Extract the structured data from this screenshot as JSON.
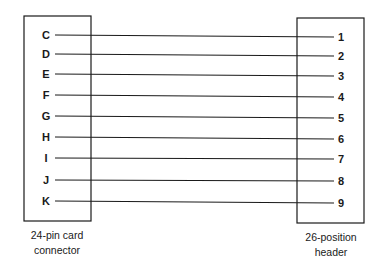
{
  "diagram": {
    "type": "wiring",
    "left_connector": {
      "caption_line1": "24-pin card",
      "caption_line2": "connector",
      "pins": [
        "C",
        "D",
        "E",
        "F",
        "G",
        "H",
        "I",
        "J",
        "K"
      ]
    },
    "right_connector": {
      "caption_line1": "26-position",
      "caption_line2": "header",
      "pins": [
        "1",
        "2",
        "3",
        "4",
        "5",
        "6",
        "7",
        "8",
        "9"
      ]
    },
    "connections": [
      {
        "from": "C",
        "to": "1"
      },
      {
        "from": "D",
        "to": "2"
      },
      {
        "from": "E",
        "to": "3"
      },
      {
        "from": "F",
        "to": "4"
      },
      {
        "from": "G",
        "to": "5"
      },
      {
        "from": "H",
        "to": "6"
      },
      {
        "from": "I",
        "to": "7"
      },
      {
        "from": "J",
        "to": "8"
      },
      {
        "from": "K",
        "to": "9"
      }
    ],
    "colors": {
      "line": "#1a1a1a",
      "background": "#ffffff"
    }
  }
}
